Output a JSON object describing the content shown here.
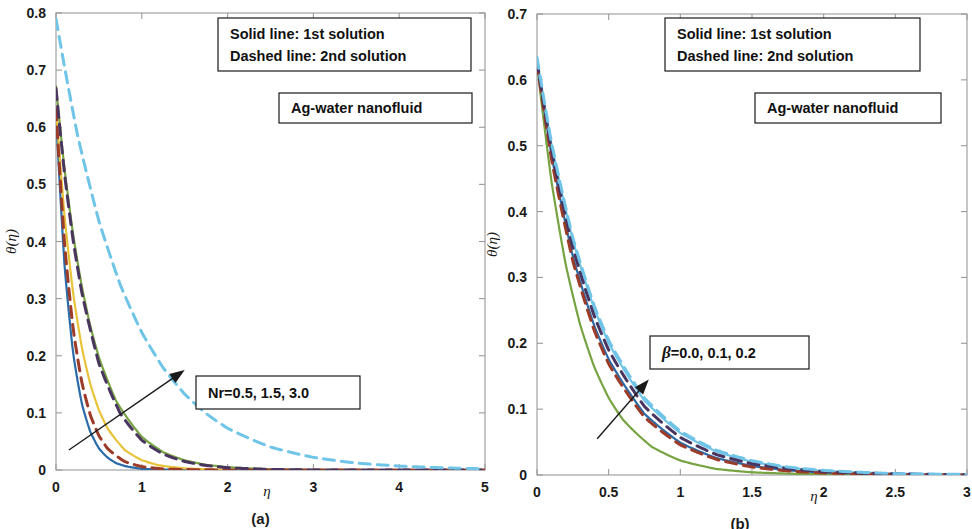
{
  "figure": {
    "background_color": "#ffffff",
    "width": 972,
    "height": 529
  },
  "panels": [
    {
      "id": "a",
      "caption": "(a)",
      "legend_box": {
        "line1": "Solid line: 1st solution",
        "line2": "Dashed line: 2nd solution"
      },
      "material_box": {
        "label": "Ag-water nanofluid"
      },
      "parameter_box": {
        "label": "Nr=0.5, 1.5, 3.0"
      },
      "xlabel": "η",
      "ylabel": "θ(η)",
      "xticks": [
        "0",
        "1",
        "2",
        "3",
        "4",
        "5"
      ],
      "yticks": [
        "0",
        "0.1",
        "0.2",
        "0.3",
        "0.4",
        "0.5",
        "0.6",
        "0.7",
        "0.8"
      ]
    },
    {
      "id": "b",
      "caption": "(b)",
      "legend_box": {
        "line1": "Solid line: 1st solution",
        "line2": "Dashed line: 2nd solution"
      },
      "material_box": {
        "label": "Ag-water nanofluid"
      },
      "parameter_box": {
        "label": "β=0.0, 0.1, 0.2"
      },
      "xlabel": "η",
      "ylabel": "θ(η)",
      "xticks": [
        "0",
        "0.5",
        "1",
        "1.5",
        "2",
        "2.5",
        "3"
      ],
      "yticks": [
        "0",
        "0.1",
        "0.2",
        "0.3",
        "0.4",
        "0.5",
        "0.6",
        "0.7"
      ]
    }
  ],
  "chart_data": [
    {
      "type": "line",
      "title": "(a) Temperature profile for varying radiation parameter Nr",
      "xlabel": "η",
      "ylabel": "θ(η)",
      "xlim": [
        0,
        5
      ],
      "ylim": [
        0,
        0.8
      ],
      "xticks": [
        0,
        1,
        2,
        3,
        4,
        5
      ],
      "yticks": [
        0,
        0.1,
        0.2,
        0.3,
        0.4,
        0.5,
        0.6,
        0.7,
        0.8
      ],
      "grid": false,
      "legend_position": "top-right-box",
      "annotations": [
        "Solid line: 1st solution",
        "Dashed line: 2nd solution",
        "Ag-water nanofluid",
        "Nr=0.5, 1.5, 3.0"
      ],
      "arrow": {
        "from": [
          0.15,
          0.035
        ],
        "to": [
          1.5,
          0.175
        ],
        "meaning": "direction of increasing Nr"
      },
      "parameter_name": "Nr",
      "parameter_values": [
        0.5,
        1.5,
        3.0
      ],
      "series": [
        {
          "name": "Nr=0.5 (1st solution)",
          "style": "solid",
          "color": "#2b6ba8",
          "theta0": 0.625,
          "decay": 5.6,
          "x": [
            0,
            0.1,
            0.2,
            0.3,
            0.4,
            0.5,
            0.6,
            0.7,
            0.8,
            1.0,
            1.2,
            1.5,
            2.0,
            2.5,
            3.0,
            4.0,
            5.0
          ],
          "y": [
            0.625,
            0.357,
            0.204,
            0.117,
            0.067,
            0.038,
            0.022,
            0.012,
            0.007,
            0.002,
            0.001,
            0.0,
            0.0,
            0.0,
            0.0,
            0.0,
            0.0
          ]
        },
        {
          "name": "Nr=1.5 (1st solution)",
          "style": "solid",
          "color": "#e8c33a",
          "theta0": 0.635,
          "decay": 3.6,
          "x": [
            0,
            0.1,
            0.2,
            0.3,
            0.4,
            0.5,
            0.6,
            0.8,
            1.0,
            1.2,
            1.5,
            2.0,
            2.5,
            3.0,
            4.0,
            5.0
          ],
          "y": [
            0.635,
            0.443,
            0.309,
            0.215,
            0.15,
            0.105,
            0.073,
            0.035,
            0.017,
            0.008,
            0.003,
            0.0,
            0.0,
            0.0,
            0.0,
            0.0
          ]
        },
        {
          "name": "Nr=3.0 (1st solution)",
          "style": "solid",
          "color": "#77a342",
          "theta0": 0.672,
          "decay": 2.45,
          "x": [
            0,
            0.1,
            0.2,
            0.3,
            0.4,
            0.5,
            0.7,
            1.0,
            1.25,
            1.5,
            1.75,
            2.0,
            2.5,
            3.0,
            4.0,
            5.0
          ],
          "y": [
            0.672,
            0.526,
            0.412,
            0.322,
            0.252,
            0.197,
            0.121,
            0.058,
            0.031,
            0.017,
            0.009,
            0.005,
            0.001,
            0.0,
            0.0,
            0.0
          ]
        },
        {
          "name": "Nr=0.5 (2nd solution)",
          "style": "dashed",
          "color": "#9c3b28",
          "theta0": 0.632,
          "decay": 4.7,
          "x": [
            0,
            0.1,
            0.2,
            0.3,
            0.4,
            0.5,
            0.6,
            0.8,
            1.0,
            1.25,
            1.5,
            2.0,
            2.5,
            3.0,
            4.0,
            5.0
          ],
          "y": [
            0.632,
            0.395,
            0.247,
            0.154,
            0.096,
            0.06,
            0.038,
            0.015,
            0.006,
            0.002,
            0.001,
            0.0,
            0.0,
            0.0,
            0.0,
            0.0
          ]
        },
        {
          "name": "Nr=1.5 (2nd solution)",
          "style": "dashed",
          "color": "#4a3560",
          "theta0": 0.668,
          "decay": 2.55,
          "x": [
            0,
            0.1,
            0.2,
            0.3,
            0.5,
            0.75,
            1.0,
            1.25,
            1.5,
            1.75,
            2.0,
            2.5,
            3.0,
            4.0,
            5.0
          ],
          "y": [
            0.668,
            0.518,
            0.402,
            0.312,
            0.187,
            0.099,
            0.052,
            0.028,
            0.015,
            0.008,
            0.004,
            0.001,
            0.0,
            0.0,
            0.0
          ]
        },
        {
          "name": "Nr=3.0 (2nd solution)",
          "style": "dashed",
          "color": "#6fc4e8",
          "theta0": 0.79,
          "decay": 1.19,
          "x": [
            0,
            0.25,
            0.5,
            0.75,
            1.0,
            1.25,
            1.5,
            1.75,
            2.0,
            2.5,
            3.0,
            3.5,
            4.0,
            4.5,
            5.0
          ],
          "y": [
            0.79,
            0.587,
            0.436,
            0.324,
            0.241,
            0.179,
            0.133,
            0.099,
            0.073,
            0.04,
            0.022,
            0.012,
            0.007,
            0.004,
            0.002
          ]
        }
      ]
    },
    {
      "type": "line",
      "title": "(b) Temperature profile for varying Casson parameter β",
      "xlabel": "η",
      "ylabel": "θ(η)",
      "xlim": [
        0,
        3
      ],
      "ylim": [
        0,
        0.7
      ],
      "xticks": [
        0,
        0.5,
        1,
        1.5,
        2,
        2.5,
        3
      ],
      "yticks": [
        0,
        0.1,
        0.2,
        0.3,
        0.4,
        0.5,
        0.6,
        0.7
      ],
      "grid": false,
      "legend_position": "top-right-box",
      "annotations": [
        "Solid line: 1st solution",
        "Dashed line: 2nd solution",
        "Ag-water nanofluid",
        "β=0.0, 0.1, 0.2"
      ],
      "arrow": {
        "from": [
          0.42,
          0.055
        ],
        "to": [
          0.78,
          0.145
        ],
        "meaning": "direction of increasing β"
      },
      "parameter_name": "β",
      "parameter_values": [
        0.0,
        0.1,
        0.2
      ],
      "series": [
        {
          "name": "β=0.0 (1st solution)",
          "style": "solid",
          "color": "#77a342",
          "theta0": 0.625,
          "decay": 3.35,
          "x": [
            0,
            0.1,
            0.2,
            0.3,
            0.4,
            0.5,
            0.6,
            0.8,
            1.0,
            1.25,
            1.5,
            2.0,
            2.5,
            3.0
          ],
          "y": [
            0.625,
            0.447,
            0.32,
            0.229,
            0.164,
            0.117,
            0.084,
            0.043,
            0.022,
            0.009,
            0.004,
            0.001,
            0.0,
            0.0
          ]
        },
        {
          "name": "β=0.1 (1st solution)",
          "style": "solid",
          "color": "#2b6ba8",
          "theta0": 0.628,
          "decay": 2.55,
          "x": [
            0,
            0.1,
            0.25,
            0.4,
            0.5,
            0.75,
            1.0,
            1.25,
            1.5,
            1.75,
            2.0,
            2.5,
            3.0
          ],
          "y": [
            0.628,
            0.487,
            0.332,
            0.226,
            0.176,
            0.093,
            0.049,
            0.026,
            0.014,
            0.007,
            0.004,
            0.001,
            0.0
          ]
        },
        {
          "name": "β=0.2 (1st solution)",
          "style": "solid",
          "color": "#6fc4e8",
          "theta0": 0.633,
          "decay": 2.3,
          "x": [
            0,
            0.1,
            0.25,
            0.4,
            0.5,
            0.75,
            1.0,
            1.25,
            1.5,
            1.75,
            2.0,
            2.5,
            3.0
          ],
          "y": [
            0.633,
            0.503,
            0.356,
            0.252,
            0.2,
            0.113,
            0.064,
            0.036,
            0.02,
            0.011,
            0.006,
            0.002,
            0.001
          ]
        },
        {
          "name": "β=0.0 (2nd solution)",
          "style": "dashed",
          "color": "#9c3b28",
          "theta0": 0.625,
          "decay": 2.62,
          "x": [
            0,
            0.1,
            0.25,
            0.4,
            0.5,
            0.75,
            1.0,
            1.25,
            1.5,
            1.75,
            2.0,
            2.5,
            3.0
          ],
          "y": [
            0.625,
            0.481,
            0.325,
            0.219,
            0.169,
            0.088,
            0.046,
            0.024,
            0.012,
            0.006,
            0.003,
            0.001,
            0.0
          ]
        },
        {
          "name": "β=0.1 (2nd solution)",
          "style": "dashed",
          "color": "#4a3560",
          "theta0": 0.629,
          "decay": 2.4,
          "x": [
            0,
            0.1,
            0.25,
            0.4,
            0.5,
            0.75,
            1.0,
            1.25,
            1.5,
            1.75,
            2.0,
            2.5,
            3.0
          ],
          "y": [
            0.629,
            0.495,
            0.345,
            0.241,
            0.19,
            0.104,
            0.057,
            0.031,
            0.017,
            0.01,
            0.005,
            0.002,
            0.0
          ]
        },
        {
          "name": "β=0.2 (2nd solution)",
          "style": "dashed",
          "color": "#6fc4e8",
          "theta0": 0.634,
          "decay": 2.26,
          "x": [
            0,
            0.1,
            0.25,
            0.4,
            0.5,
            0.75,
            1.0,
            1.25,
            1.5,
            1.75,
            2.0,
            2.5,
            3.0
          ],
          "y": [
            0.634,
            0.506,
            0.36,
            0.256,
            0.204,
            0.117,
            0.067,
            0.038,
            0.022,
            0.012,
            0.007,
            0.002,
            0.001
          ]
        }
      ]
    }
  ]
}
